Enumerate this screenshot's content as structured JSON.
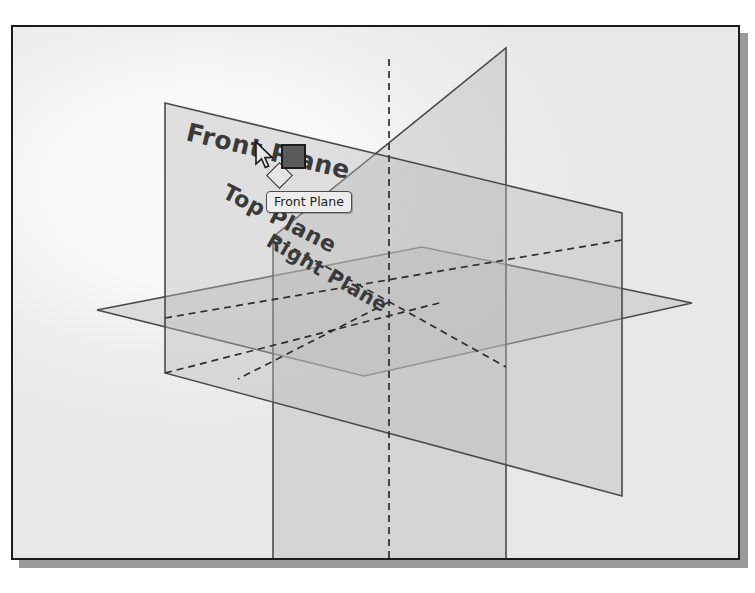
{
  "app": {
    "title": "SolidWorks 3D reference planes viewport"
  },
  "viewport": {
    "background_color": "#f1f1f1",
    "frame_color": "#1b1b1b",
    "shadow_color": "#9a9a9a"
  },
  "planes": [
    {
      "id": "front",
      "label": "Front Plane",
      "state": "highlighted",
      "edge_color": "#4a4a4a",
      "fill_color": "#b9b9b9"
    },
    {
      "id": "top",
      "label": "Top Plane",
      "state": "normal",
      "edge_color": "#4a4a4a",
      "fill_color": "#b9b9b9"
    },
    {
      "id": "right",
      "label": "Right Plane",
      "state": "normal",
      "edge_color": "#4a4a4a",
      "fill_color": "#b9b9b9"
    }
  ],
  "tooltip": {
    "text": "Front Plane",
    "background": "#ededed",
    "border_color": "#4d4d4d"
  },
  "cursor": {
    "icon": "arrow-pointer-icon"
  },
  "selection_marker": {
    "icon": "selected-face-square-icon",
    "color": "#5a5a5a"
  },
  "plane_glyph": {
    "icon": "plane-rhombus-icon"
  },
  "geometry": {
    "front_plane_points": "163,101 620,211 620,494 163,371",
    "top_plane_points": "95,308 420,245 690,301 362,374",
    "right_plane_points": "504,46 504,568 271,568 271,235",
    "center": "385,300"
  }
}
